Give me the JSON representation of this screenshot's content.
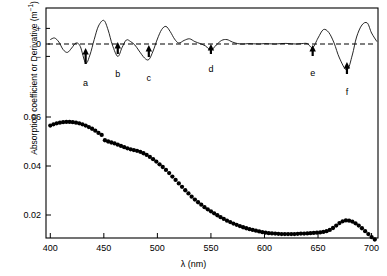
{
  "figure": {
    "name": "absorption-spectrum-and-fourth-derivative",
    "background": "#ffffff",
    "line_color": "#000000",
    "marker_color": "#000000"
  },
  "axes": {
    "x_title_prefix": "λ",
    "x_title_units": "(nm)",
    "y_title": "Absorption coefficient or Derivative (m",
    "y_title_exponent": "−1",
    "y_title_suffix": ")",
    "x_ticks": [
      "400",
      "450",
      "500",
      "550",
      "600",
      "650",
      "700"
    ],
    "y_ticks": [
      "0.02",
      "0.04",
      "0.06"
    ],
    "derivative_signs": {
      "plus": "+",
      "zero": "0",
      "minus": "−"
    }
  },
  "annotations": {
    "arrows": [
      {
        "label": "a",
        "lambda": 433
      },
      {
        "label": "b",
        "lambda": 463
      },
      {
        "label": "c",
        "lambda": 492
      },
      {
        "label": "d",
        "lambda": 550
      },
      {
        "label": "e",
        "lambda": 645
      },
      {
        "label": "f",
        "lambda": 677
      }
    ]
  },
  "chart_data": {
    "type": "line",
    "title": "",
    "subtitle": "",
    "xlabel": "λ (nm)",
    "ylabel": "Absorption coefficient or Derivative (m−1)",
    "xlim": [
      396,
      706
    ],
    "ylim": [
      0.0,
      0.066
    ],
    "grid": false,
    "legend": "none",
    "x_tick_values": [
      400,
      450,
      500,
      550,
      600,
      650,
      700
    ],
    "y_tick_values": [
      0.02,
      0.04,
      0.06
    ],
    "annotation_arrows": [
      {
        "label": "a",
        "x": 433,
        "note": "fourth-derivative minimum"
      },
      {
        "label": "b",
        "x": 463,
        "note": "fourth-derivative minimum"
      },
      {
        "label": "c",
        "x": 492,
        "note": "fourth-derivative minimum"
      },
      {
        "label": "d",
        "x": 550,
        "note": "fourth-derivative minimum"
      },
      {
        "label": "e",
        "x": 645,
        "note": "fourth-derivative minimum"
      },
      {
        "label": "f",
        "x": 677,
        "note": "fourth-derivative minimum, chlorophyll a red peak"
      }
    ],
    "series": [
      {
        "name": "Absorption coefficient",
        "style": "filled-circles",
        "axis": "left",
        "x": [
          400,
          403,
          406,
          409,
          412,
          415,
          418,
          421,
          424,
          427,
          430,
          433,
          436,
          439,
          442,
          445,
          448,
          451,
          454,
          457,
          460,
          463,
          466,
          469,
          472,
          475,
          478,
          481,
          484,
          487,
          490,
          493,
          496,
          499,
          502,
          505,
          508,
          511,
          514,
          517,
          520,
          523,
          526,
          529,
          532,
          535,
          538,
          541,
          544,
          547,
          550,
          553,
          556,
          559,
          562,
          565,
          568,
          571,
          574,
          577,
          580,
          583,
          586,
          589,
          592,
          595,
          598,
          601,
          604,
          607,
          610,
          613,
          616,
          619,
          622,
          625,
          628,
          631,
          634,
          637,
          640,
          643,
          646,
          649,
          652,
          655,
          658,
          661,
          664,
          667,
          670,
          673,
          676,
          679,
          682,
          685,
          688,
          691,
          694,
          697,
          700,
          703
        ],
        "y": [
          0.0565,
          0.057,
          0.0574,
          0.0577,
          0.0579,
          0.058,
          0.058,
          0.0579,
          0.0577,
          0.0574,
          0.057,
          0.0565,
          0.0559,
          0.0552,
          0.0544,
          0.0535,
          0.0527,
          0.0505,
          0.05,
          0.0496,
          0.0492,
          0.0487,
          0.0482,
          0.0477,
          0.0472,
          0.0468,
          0.0465,
          0.0462,
          0.0458,
          0.0452,
          0.0445,
          0.0437,
          0.0428,
          0.0418,
          0.0407,
          0.0396,
          0.0384,
          0.0371,
          0.0357,
          0.0343,
          0.0329,
          0.0315,
          0.0301,
          0.0288,
          0.0275,
          0.0263,
          0.0252,
          0.0242,
          0.0232,
          0.0223,
          0.0215,
          0.0207,
          0.0199,
          0.0191,
          0.0184,
          0.0177,
          0.0171,
          0.0165,
          0.016,
          0.0155,
          0.015,
          0.0146,
          0.0142,
          0.0139,
          0.0136,
          0.0133,
          0.013,
          0.0128,
          0.0126,
          0.0125,
          0.0124,
          0.0123,
          0.0122,
          0.0122,
          0.0122,
          0.0122,
          0.0122,
          0.0123,
          0.0124,
          0.0124,
          0.0125,
          0.0126,
          0.0127,
          0.0128,
          0.0129,
          0.0131,
          0.0134,
          0.0139,
          0.0147,
          0.0157,
          0.0167,
          0.0174,
          0.0178,
          0.0177,
          0.0173,
          0.0166,
          0.0157,
          0.0146,
          0.0134,
          0.0122,
          0.011,
          0.01
        ]
      },
      {
        "name": "Fourth derivative",
        "style": "thin-line",
        "axis": "right-derivative",
        "x": [
          400,
          404,
          408,
          412,
          416,
          420,
          424,
          428,
          433,
          437,
          441,
          445,
          450,
          454,
          458,
          463,
          467,
          471,
          475,
          479,
          483,
          488,
          492,
          496,
          500,
          504,
          508,
          512,
          516,
          520,
          525,
          530,
          535,
          540,
          545,
          550,
          555,
          560,
          565,
          570,
          575,
          580,
          585,
          590,
          595,
          600,
          605,
          610,
          615,
          620,
          625,
          630,
          635,
          640,
          645,
          650,
          655,
          660,
          665,
          670,
          677,
          682,
          686,
          691,
          696,
          700,
          705
        ],
        "d": [
          0.22,
          0.3,
          0.1,
          -0.28,
          -0.42,
          -0.2,
          0.05,
          -0.12,
          -0.95,
          -0.55,
          0.22,
          0.9,
          1.18,
          0.7,
          -0.05,
          -0.62,
          -0.18,
          0.2,
          0.12,
          -0.05,
          -0.35,
          -0.7,
          -0.78,
          -0.35,
          0.25,
          0.72,
          0.88,
          0.62,
          0.25,
          0.05,
          0.18,
          0.26,
          0.12,
          0.02,
          -0.1,
          -0.3,
          -0.05,
          0.18,
          0.22,
          0.1,
          0.02,
          0.0,
          0.02,
          0.01,
          0.0,
          0.02,
          0.01,
          0.0,
          0.02,
          0.03,
          0.01,
          0.0,
          0.02,
          0.02,
          -0.18,
          0.3,
          0.72,
          0.58,
          0.05,
          -0.7,
          -1.3,
          -0.55,
          0.35,
          0.95,
          1.05,
          0.55,
          0.12
        ]
      }
    ]
  }
}
